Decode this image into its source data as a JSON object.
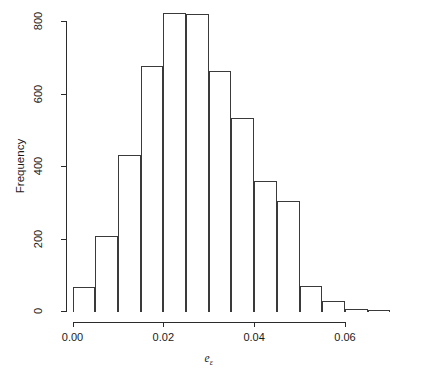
{
  "figure": {
    "background_color": "#ffffff",
    "line_color": "#2b2b2b",
    "bar_border_color": "#3a3a3a",
    "bar_fill_color": "transparent",
    "width": 422,
    "height": 381
  },
  "axes": {
    "y_title": "Frequency",
    "x_title_base": "e",
    "x_title_sub": "ε",
    "y_ticks": [
      "0",
      "200",
      "400",
      "600",
      "800"
    ],
    "y_tick_values": [
      0,
      200,
      400,
      600,
      800
    ],
    "x_ticks": [
      "0.00",
      "0.02",
      "0.04",
      "0.06"
    ],
    "x_tick_values": [
      0.0,
      0.02,
      0.04,
      0.06
    ]
  },
  "chart_data": {
    "type": "bar",
    "title": "",
    "subtitle": "",
    "xlabel": "e_ε",
    "ylabel": "Frequency",
    "grid": false,
    "legend": "none",
    "bin_width": 0.005,
    "bin_edges": [
      0.0,
      0.005,
      0.01,
      0.015,
      0.02,
      0.025,
      0.03,
      0.035,
      0.04,
      0.045,
      0.05,
      0.055,
      0.06,
      0.065,
      0.07
    ],
    "categories": [
      "0.000-0.005",
      "0.005-0.010",
      "0.010-0.015",
      "0.015-0.020",
      "0.020-0.025",
      "0.025-0.030",
      "0.030-0.035",
      "0.035-0.040",
      "0.040-0.045",
      "0.045-0.050",
      "0.050-0.055",
      "0.055-0.060",
      "0.060-0.065",
      "0.065-0.070"
    ],
    "values": [
      66,
      207,
      430,
      675,
      823,
      818,
      663,
      533,
      358,
      303,
      68,
      28,
      6,
      2
    ],
    "xlim": [
      0.0,
      0.07
    ],
    "ylim": [
      0,
      830
    ],
    "x_axis_draw_range": [
      0.0,
      0.06
    ],
    "y_axis_draw_range": [
      0,
      800
    ]
  }
}
